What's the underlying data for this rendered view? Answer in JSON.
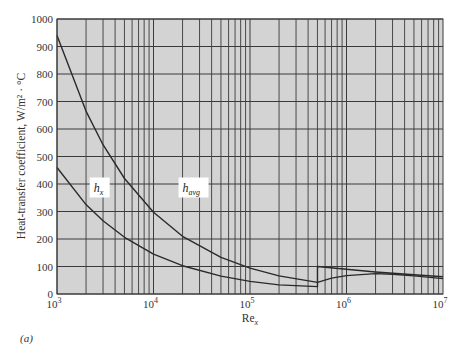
{
  "chart_data": {
    "type": "line",
    "title": "",
    "panel_label": "(a)",
    "xlabel": "Re",
    "xlabel_sub": "x",
    "ylabel": "Heat-transfer coefficient, W/m² · °C",
    "xscale": "log",
    "xlim": [
      1000,
      10000000
    ],
    "ylim": [
      0,
      1000
    ],
    "grid": true,
    "background": "#d3d3d3",
    "grid_color": "#3a3a3a",
    "line_color": "#2a2a2a",
    "x_ticks": [
      {
        "value": 1000,
        "base": "10",
        "exp": "3"
      },
      {
        "value": 10000,
        "base": "10",
        "exp": "4"
      },
      {
        "value": 100000,
        "base": "10",
        "exp": "5"
      },
      {
        "value": 1000000,
        "base": "10",
        "exp": "6"
      },
      {
        "value": 10000000,
        "base": "10",
        "exp": "7"
      }
    ],
    "y_ticks": [
      0,
      100,
      200,
      300,
      400,
      500,
      600,
      700,
      800,
      900,
      1000
    ],
    "series": [
      {
        "name": "h_x",
        "label_main": "h",
        "label_sub": "x",
        "label_pos": {
          "x": 2400,
          "y": 380
        },
        "points": [
          [
            1000,
            460
          ],
          [
            2000,
            325
          ],
          [
            3000,
            266
          ],
          [
            5000,
            206
          ],
          [
            10000,
            145
          ],
          [
            20000,
            103
          ],
          [
            50000,
            65
          ],
          [
            100000,
            46
          ],
          [
            200000,
            33
          ],
          [
            500000,
            27
          ],
          [
            500000,
            100
          ],
          [
            1000000,
            90
          ],
          [
            2000000,
            80
          ],
          [
            5000000,
            70
          ],
          [
            10000000,
            63
          ]
        ]
      },
      {
        "name": "h_avg",
        "label_main": "h",
        "label_sub": "avg",
        "label_pos": {
          "x": 20000,
          "y": 380
        },
        "points": [
          [
            1000,
            940
          ],
          [
            2000,
            665
          ],
          [
            3000,
            543
          ],
          [
            5000,
            420
          ],
          [
            10000,
            297
          ],
          [
            20000,
            210
          ],
          [
            50000,
            133
          ],
          [
            100000,
            94
          ],
          [
            200000,
            66
          ],
          [
            500000,
            42
          ],
          [
            700000,
            58
          ],
          [
            1000000,
            67
          ],
          [
            2000000,
            74
          ],
          [
            3000000,
            72
          ],
          [
            5000000,
            66
          ],
          [
            10000000,
            56
          ]
        ]
      }
    ]
  }
}
